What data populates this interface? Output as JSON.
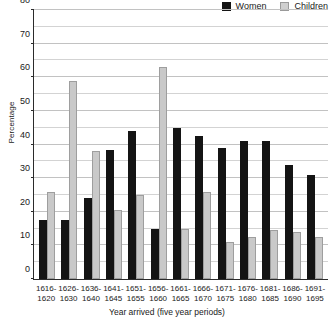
{
  "chart_data": {
    "type": "bar",
    "title": "",
    "xlabel": "Year arrived (five year periods)",
    "ylabel": "Percentage",
    "ylim": [
      0,
      80
    ],
    "ytick_step": 10,
    "gridline_step": 5,
    "grid": true,
    "legend_position": "top-right",
    "categories": [
      "1616-1620",
      "1626-1630",
      "1636-1640",
      "1641-1645",
      "1651-1655",
      "1656-1660",
      "1661-1665",
      "1666-1670",
      "1671-1675",
      "1676-1680",
      "1681-1685",
      "1686-1690",
      "1691-1695"
    ],
    "categories_line1": [
      "1616-",
      "1626-",
      "1636-",
      "1641-",
      "1651-",
      "1656-",
      "1661-",
      "1666-",
      "1671-",
      "1676-",
      "1681-",
      "1686-",
      "1691-"
    ],
    "categories_line2": [
      "1620",
      "1630",
      "1640",
      "1645",
      "1655",
      "1660",
      "1665",
      "1670",
      "1675",
      "1680",
      "1685",
      "1690",
      "1695"
    ],
    "ytick_labels": [
      "0",
      "10",
      "20",
      "30",
      "40",
      "50",
      "60",
      "70",
      "80"
    ],
    "ytick_values": [
      0,
      10,
      20,
      30,
      40,
      50,
      60,
      70,
      80
    ],
    "series": [
      {
        "name": "Women",
        "color": "#141414",
        "values": [
          17.5,
          17.5,
          24,
          38.5,
          44,
          15,
          45,
          42.5,
          39,
          41,
          41,
          34,
          31
        ]
      },
      {
        "name": "Children",
        "color": "#c9c9c9",
        "values": [
          26,
          59,
          38,
          20.5,
          25,
          63,
          15,
          26,
          11,
          12.5,
          14.5,
          14,
          12.5
        ]
      }
    ]
  }
}
